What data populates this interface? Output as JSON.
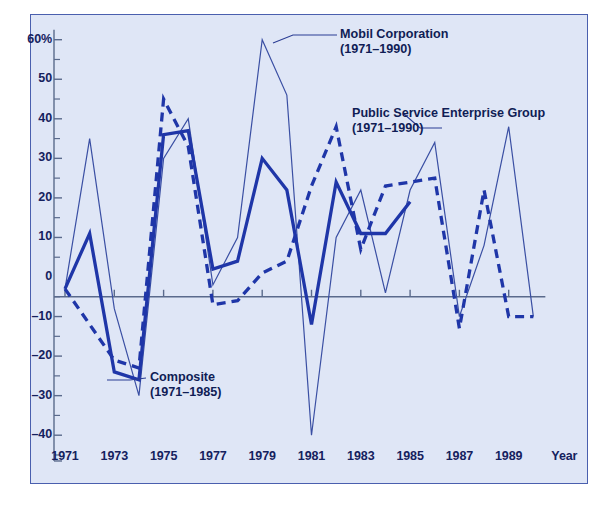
{
  "chart_data": {
    "type": "line",
    "title": "",
    "xlabel": "Year",
    "ylabel": "",
    "ylim": [
      -45,
      62
    ],
    "xlim": [
      1970.4,
      1990.6
    ],
    "grid": false,
    "legend": "inline annotations",
    "y_unit": "%",
    "y_ticks": [
      {
        "value": 60,
        "label": "60%"
      },
      {
        "value": 50,
        "label": "50"
      },
      {
        "value": 40,
        "label": "40"
      },
      {
        "value": 30,
        "label": "30"
      },
      {
        "value": 20,
        "label": "20"
      },
      {
        "value": 10,
        "label": "10"
      },
      {
        "value": 0,
        "label": "0"
      },
      {
        "value": -10,
        "label": "–10"
      },
      {
        "value": -20,
        "label": "–20"
      },
      {
        "value": -30,
        "label": "–30"
      },
      {
        "value": -40,
        "label": "–40"
      }
    ],
    "y_minor_ticks": [
      55,
      45,
      35,
      25,
      15,
      5,
      -5,
      -15,
      -25,
      -35,
      -45
    ],
    "x_ticks": [
      {
        "value": 1971,
        "label": "1971"
      },
      {
        "value": 1973,
        "label": "1973"
      },
      {
        "value": 1975,
        "label": "1975"
      },
      {
        "value": 1977,
        "label": "1977"
      },
      {
        "value": 1979,
        "label": "1979"
      },
      {
        "value": 1981,
        "label": "1981"
      },
      {
        "value": 1983,
        "label": "1983"
      },
      {
        "value": 1985,
        "label": "1985"
      },
      {
        "value": 1987,
        "label": "1987"
      },
      {
        "value": 1989,
        "label": "1989"
      }
    ],
    "x_minor_ticks": [
      1972,
      1974,
      1976,
      1978,
      1980,
      1982,
      1984,
      1986,
      1988,
      1990
    ],
    "x_axis_caption": "Year",
    "series": [
      {
        "name": "Mobil Corporation",
        "period": "(1971–1990)",
        "style": "thin-solid",
        "color": "#3a4fa3",
        "width": 1.2,
        "x": [
          1971,
          1972,
          1973,
          1974,
          1975,
          1976,
          1977,
          1978,
          1979,
          1980,
          1981,
          1982,
          1983,
          1984,
          1985,
          1986,
          1987,
          1988,
          1989,
          1990
        ],
        "values": [
          -3,
          35,
          -8,
          -30,
          30,
          40,
          -2,
          10,
          60,
          46,
          -40,
          10,
          22,
          -4,
          22,
          34,
          -10,
          8,
          38,
          -10
        ]
      },
      {
        "name": "Composite",
        "period": "(1971–1985)",
        "style": "thick-solid",
        "color": "#1f36a8",
        "width": 3.3,
        "x": [
          1971,
          1972,
          1973,
          1974,
          1975,
          1976,
          1977,
          1978,
          1979,
          1980,
          1981,
          1982,
          1983,
          1984,
          1985
        ],
        "values": [
          -3,
          11,
          -24,
          -26,
          36,
          37,
          2,
          4,
          30,
          22,
          -12,
          24,
          11,
          11,
          19
        ]
      },
      {
        "name": "Public Service Enterprise Group",
        "period": "(1971–1990)",
        "style": "thick-dashed",
        "color": "#1f36a8",
        "width": 3.3,
        "x": [
          1971,
          1972,
          1973,
          1974,
          1975,
          1976,
          1977,
          1978,
          1979,
          1980,
          1981,
          1982,
          1983,
          1984,
          1985,
          1986,
          1987,
          1988,
          1989,
          1990
        ],
        "values": [
          -3,
          -12,
          -21,
          -23,
          45,
          33,
          -7,
          -6,
          1,
          4,
          23,
          38,
          7,
          23,
          24,
          25,
          -13,
          22,
          -10,
          -10
        ]
      }
    ],
    "annotations": [
      {
        "id": "mobil",
        "line1": "Mobil Corporation",
        "line2": "(1971–1990)"
      },
      {
        "id": "pseg",
        "line1": "Public Service Enterprise Group",
        "line2": "(1971–1990)"
      },
      {
        "id": "composite",
        "line1": "Composite",
        "line2": "(1971–1985)"
      }
    ],
    "colors": {
      "panel_background": "#dfe6f6",
      "panel_border": "#4a5fae",
      "axis": "#5a6a8c",
      "text": "#15215e",
      "thin_line": "#3a4fa3",
      "thick_line": "#1f36a8"
    }
  }
}
